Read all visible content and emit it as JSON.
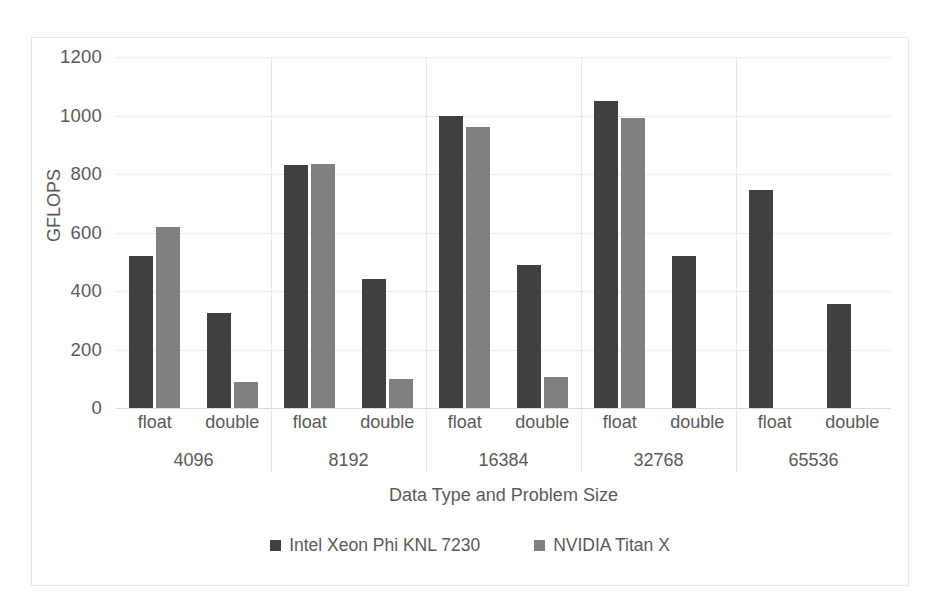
{
  "chart_data": {
    "type": "bar",
    "title": "",
    "xlabel": "Data Type and Problem Size",
    "ylabel": "GFLOPS",
    "ylim": [
      0,
      1200
    ],
    "yticks": [
      0,
      200,
      400,
      600,
      800,
      1000,
      1200
    ],
    "ytick_labels": [
      "0",
      "200",
      "400",
      "600",
      "800",
      "1000",
      "1200"
    ],
    "grid": true,
    "legend_position": "bottom",
    "categories": [
      "float",
      "double",
      "float",
      "double",
      "float",
      "double",
      "float",
      "double",
      "float",
      "double"
    ],
    "group_labels": [
      "4096",
      "8192",
      "16384",
      "32768",
      "65536"
    ],
    "series": [
      {
        "name": "Intel Xeon Phi KNL 7230",
        "color": "#404040",
        "values": [
          520,
          325,
          830,
          440,
          1000,
          490,
          1050,
          520,
          745,
          355
        ]
      },
      {
        "name": "NVIDIA Titan X",
        "color": "#808080",
        "values": [
          620,
          90,
          835,
          100,
          960,
          105,
          990,
          null,
          null,
          null
        ]
      }
    ]
  },
  "legend": {
    "items": [
      {
        "label": "Intel Xeon Phi KNL 7230",
        "color": "#404040",
        "swatch": "square-swatch"
      },
      {
        "label": "NVIDIA Titan X",
        "color": "#808080",
        "swatch": "square-swatch"
      }
    ]
  }
}
